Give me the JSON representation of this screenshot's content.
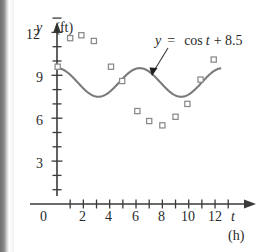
{
  "chart_data": {
    "type": "scatter",
    "title": "",
    "xlabel": "t",
    "xunit": "(h)",
    "ylabel": "y",
    "yunit": "(ft)",
    "xlim": [
      0,
      13.3
    ],
    "ylim": [
      0,
      13.0
    ],
    "grid": false,
    "x_ticks_major": [
      0,
      2,
      4,
      6,
      8,
      10,
      12
    ],
    "x_ticks_minor": [
      1,
      3,
      5,
      7,
      9,
      11,
      13
    ],
    "x_tick_labels": [
      "0",
      "2",
      "4",
      "6",
      "8",
      "10",
      "12"
    ],
    "y_ticks_major": [
      3,
      6,
      9,
      12
    ],
    "y_ticks_minor": [
      1,
      2,
      4,
      5,
      7,
      8,
      10,
      11,
      13
    ],
    "y_tick_labels": [
      "3",
      "6",
      "9",
      "12"
    ],
    "series": [
      {
        "name": "data-points",
        "type": "scatter",
        "marker": "open-square",
        "points": [
          [
            0.05,
            9.6
          ],
          [
            1.0,
            11.6
          ],
          [
            1.85,
            11.8
          ],
          [
            2.8,
            11.4
          ],
          [
            4.1,
            9.6
          ],
          [
            4.95,
            8.6
          ],
          [
            6.1,
            6.5
          ],
          [
            7.0,
            5.8
          ],
          [
            8.0,
            5.5
          ],
          [
            9.0,
            6.1
          ],
          [
            9.9,
            7.0
          ],
          [
            10.9,
            8.7
          ],
          [
            11.9,
            10.1
          ]
        ]
      },
      {
        "name": "cos-fit",
        "type": "line",
        "equation": "y = cos t + 8.5",
        "amplitude": 1,
        "offset": 8.5,
        "period": 6.283,
        "t_start": 0,
        "t_end": 12.4
      }
    ],
    "annotations": [
      {
        "text": "y =  cos t + 8.5",
        "type": "equation-callout",
        "arrow_from": [
          8.2,
          11.4
        ],
        "arrow_to": [
          7.0,
          9.4
        ]
      }
    ],
    "colors": {
      "curve": "#7a7a7a",
      "axis": "#3a3a3a",
      "marker_stroke": "#8a8a8a",
      "text": "#2a2a2a",
      "background": "#ffffff"
    }
  },
  "labels": {
    "y_axis_var": "y",
    "y_axis_unit": "(ft)",
    "x_axis_var": "t",
    "x_axis_unit": "(h)",
    "origin": "0",
    "equation_lhs": "y",
    "equation_eq": "=",
    "equation_rhs": "cos",
    "equation_var": "t",
    "equation_tail": "+ 8.5",
    "tick_12": "12",
    "tick_9": "9",
    "tick_6": "6",
    "tick_3": "3",
    "tick_x2": "2",
    "tick_x4": "4",
    "tick_x6": "6",
    "tick_x8": "8",
    "tick_x10": "10",
    "tick_x12": "12"
  }
}
